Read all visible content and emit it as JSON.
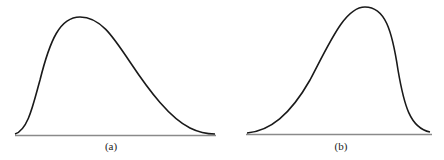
{
  "panels": [
    {
      "id": "a",
      "label": "(a)",
      "description": "Positively skewed distribution curve (long right tail)",
      "skew": "right"
    },
    {
      "id": "b",
      "label": "(b)",
      "description": "Negatively skewed distribution curve (long left tail)",
      "skew": "left"
    }
  ],
  "colors": {
    "curve": "#1a1a1a",
    "baseline": "#8a8a8a",
    "background": "#ffffff"
  }
}
